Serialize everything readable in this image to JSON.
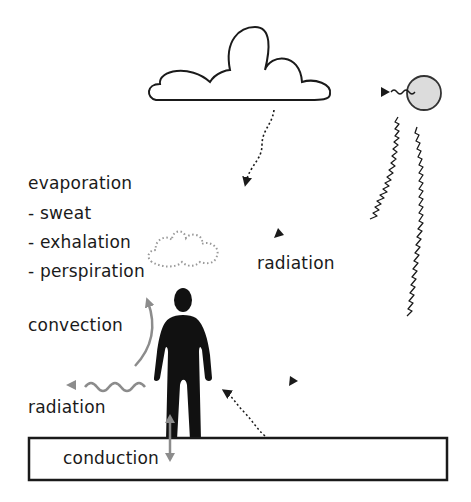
{
  "diagram": {
    "labels": {
      "evaporation": "evaporation",
      "sweat": "- sweat",
      "exhalation": "- exhalation",
      "perspiration": "- perspiration",
      "radiation_sun": "radiation",
      "convection": "convection",
      "radiation_body": "radiation",
      "conduction": "conduction"
    },
    "colors": {
      "outline": "#1a1a1a",
      "sun_fill": "#dcdcdc",
      "body_arrows": "#8c8c8c",
      "background": "#ffffff"
    },
    "elements": [
      "cloud",
      "sun",
      "person",
      "ground",
      "vapor-cloud"
    ]
  }
}
